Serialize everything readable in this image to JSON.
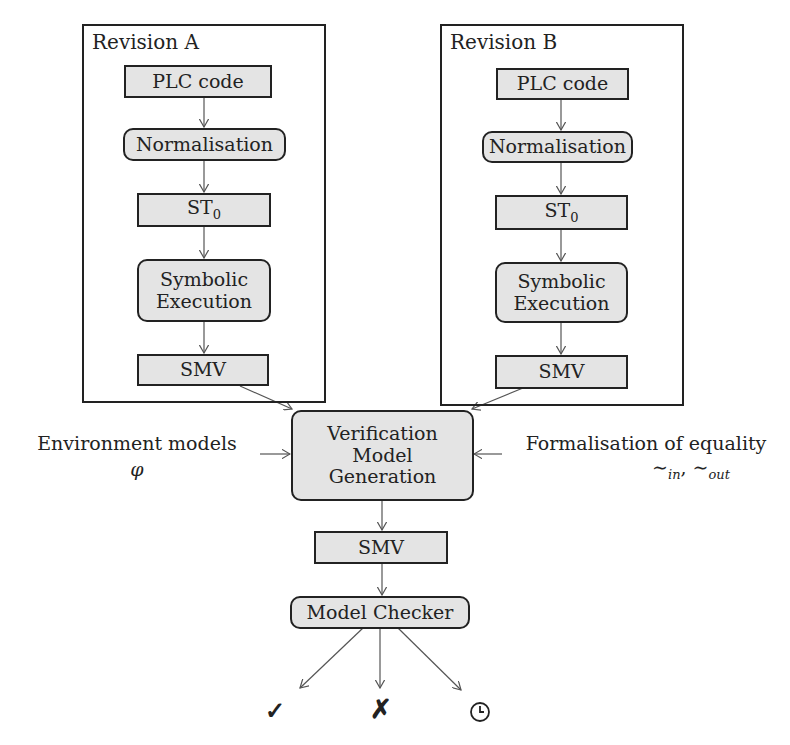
{
  "revision_a": {
    "title": "Revision A",
    "steps": [
      "PLC code",
      "Normalisation",
      "ST",
      "Symbolic Execution",
      "SMV"
    ],
    "st_subscript": "0"
  },
  "revision_b": {
    "title": "Revision B",
    "steps": [
      "PLC code",
      "Normalisation",
      "ST",
      "Symbolic Execution",
      "SMV"
    ],
    "st_subscript": "0"
  },
  "symbolic_execution_lines": [
    "Symbolic",
    "Execution"
  ],
  "verification": {
    "lines": [
      "Verification",
      "Model",
      "Generation"
    ]
  },
  "environment": {
    "label": "Environment models",
    "symbol": "φ"
  },
  "equality": {
    "label": "Formalisation of equality",
    "symbol_in": "∼",
    "sub_in": "in",
    "separator": ", ",
    "symbol_out": "∼",
    "sub_out": "out"
  },
  "output_smv": "SMV",
  "model_checker": "Model Checker",
  "results": {
    "success_icon": "✓",
    "failure_icon": "✗",
    "timeout_icon": "clock"
  }
}
